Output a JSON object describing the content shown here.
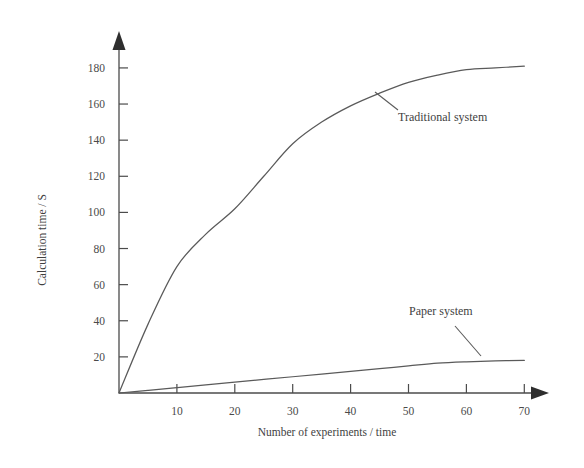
{
  "chart_data": {
    "type": "line",
    "title": "",
    "xlabel": "Number of experiments / time",
    "ylabel": "Calculation time / S",
    "xlim": [
      0,
      73
    ],
    "ylim": [
      0,
      190
    ],
    "xticks": [
      10,
      20,
      30,
      40,
      50,
      60,
      70
    ],
    "yticks": [
      20,
      40,
      60,
      80,
      100,
      120,
      140,
      160,
      180
    ],
    "grid": false,
    "legend": "inline-annotations",
    "x": [
      0,
      5,
      10,
      15,
      20,
      25,
      30,
      35,
      40,
      45,
      50,
      55,
      60,
      65,
      70
    ],
    "series": [
      {
        "name": "Traditional system",
        "label": "Traditional system",
        "color": "#5a5a5a",
        "values": [
          0,
          38,
          70,
          88,
          102,
          120,
          138,
          150,
          159,
          166,
          172,
          176,
          179,
          180,
          181
        ]
      },
      {
        "name": "Paper system",
        "label": "Paper system",
        "color": "#5a5a5a",
        "values": [
          0,
          1.5,
          3,
          4.5,
          6,
          7.5,
          9,
          10.5,
          12,
          13.5,
          15,
          16.5,
          17.3,
          17.8,
          18
        ]
      }
    ],
    "annotations": [
      {
        "text": "Traditional system",
        "series": "Traditional system",
        "label_x": 398,
        "label_y": 121,
        "leader_from_x": 375,
        "leader_from_y": 92,
        "leader_to_x": 398,
        "leader_to_y": 110
      },
      {
        "text": "Paper system",
        "series": "Paper system",
        "label_x": 409,
        "label_y": 315,
        "leader_from_x": 455,
        "leader_from_y": 326,
        "leader_to_x": 481,
        "leader_to_y": 356
      }
    ]
  },
  "axes": {
    "x_title": "Number of experiments / time",
    "y_title": "Calculation time / S",
    "x_tick_labels": [
      "10",
      "20",
      "30",
      "40",
      "50",
      "60",
      "70"
    ],
    "y_tick_labels": [
      "20",
      "40",
      "60",
      "80",
      "100",
      "120",
      "140",
      "160",
      "180"
    ]
  },
  "colors": {
    "line": "#5a5a5a",
    "axis": "#4b4b4b",
    "text": "#3f3f3f",
    "background": "#ffffff"
  }
}
